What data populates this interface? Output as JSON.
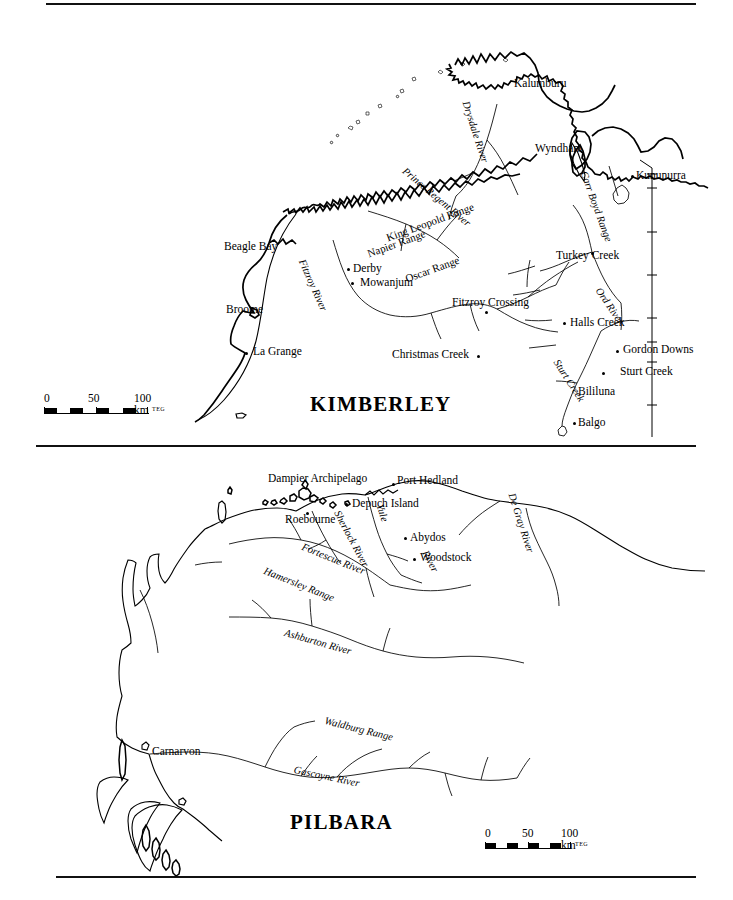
{
  "document": {
    "kind": "two-panel reference map figure",
    "top_rule": true,
    "middle_rule": true,
    "bottom_rule": true
  },
  "maps": [
    {
      "id": "kimberley",
      "title": "KIMBERLEY",
      "settlements": [
        {
          "name": "Kalumburu",
          "x": 514,
          "y": 84,
          "anchor": "left",
          "dot": false
        },
        {
          "name": "Wyndham",
          "x": 535,
          "y": 149,
          "anchor": "left",
          "dot": false
        },
        {
          "name": "Kununurra",
          "x": 636,
          "y": 176,
          "anchor": "left",
          "dot": true,
          "dot_x": 631,
          "dot_y": 174
        },
        {
          "name": "Beagle Bay",
          "x": 224,
          "y": 247,
          "anchor": "left",
          "dot": false
        },
        {
          "name": "Derby",
          "x": 353,
          "y": 269,
          "anchor": "left",
          "dot": true,
          "dot_x": 347,
          "dot_y": 268
        },
        {
          "name": "Mowanjum",
          "x": 360,
          "y": 283,
          "anchor": "left",
          "dot": true,
          "dot_x": 351,
          "dot_y": 281
        },
        {
          "name": "Broome",
          "x": 226,
          "y": 310,
          "anchor": "left",
          "dot": false
        },
        {
          "name": "Turkey Creek",
          "x": 556,
          "y": 256,
          "anchor": "left",
          "dot": true,
          "dot_x": 591,
          "dot_y": 252
        },
        {
          "name": "Fitzroy Crossing",
          "x": 452,
          "y": 303,
          "anchor": "left",
          "dot": true,
          "dot_x": 485,
          "dot_y": 311
        },
        {
          "name": "Halls Creek",
          "x": 570,
          "y": 323,
          "anchor": "left",
          "dot": true,
          "dot_x": 564,
          "dot_y": 322
        },
        {
          "name": "La Grange",
          "x": 253,
          "y": 352,
          "anchor": "left",
          "dot": true,
          "dot_x": 245,
          "dot_y": 353
        },
        {
          "name": "Christmas Creek",
          "x": 392,
          "y": 355,
          "anchor": "left",
          "dot": true,
          "dot_x": 477,
          "dot_y": 355
        },
        {
          "name": "Gordon Downs",
          "x": 623,
          "y": 350,
          "anchor": "left",
          "dot": true,
          "dot_x": 616,
          "dot_y": 350
        },
        {
          "name": "Sturt Creek",
          "x": 620,
          "y": 372,
          "anchor": "left",
          "dot": true,
          "dot_x": 602,
          "dot_y": 372
        },
        {
          "name": "Bililuna",
          "x": 578,
          "y": 392,
          "anchor": "left",
          "dot": false
        },
        {
          "name": "Balgo",
          "x": 578,
          "y": 423,
          "anchor": "left",
          "dot": true,
          "dot_x": 573,
          "dot_y": 422
        }
      ],
      "physical_labels": [
        {
          "name": "Drysdale River",
          "x": 470,
          "y": 100,
          "rotate": 72,
          "style": "italic"
        },
        {
          "name": "Prince Regent River",
          "x": 407,
          "y": 166,
          "rotate": 40,
          "style": "italic"
        },
        {
          "name": "Carr Boyd Range",
          "x": 588,
          "y": 170,
          "rotate": 70,
          "style": "italic"
        },
        {
          "name": "Fitzroy River",
          "x": 306,
          "y": 258,
          "rotate": 66,
          "style": "italic"
        },
        {
          "name": "King Leopold Range",
          "x": 385,
          "y": 233,
          "rotate": 20,
          "style": "italic-upright"
        },
        {
          "name": "Napier Range",
          "x": 366,
          "y": 247,
          "rotate": 20,
          "style": "italic-upright"
        },
        {
          "name": "Oscar Range",
          "x": 404,
          "y": 272,
          "rotate": 20,
          "style": "italic-upright"
        },
        {
          "name": "Ord River",
          "x": 604,
          "y": 289,
          "rotate": 56,
          "style": "italic"
        },
        {
          "name": "Sturt Creek",
          "x": 562,
          "y": 360,
          "rotate": 57,
          "style": "italic"
        }
      ],
      "scale": {
        "zero": "0",
        "mid": "50",
        "max": "100 km",
        "credit": "TEG",
        "x": 44,
        "y": 396
      },
      "title_pos": {
        "x": 310,
        "y": 396
      }
    },
    {
      "id": "pilbara",
      "title": "PILBARA",
      "settlements": [
        {
          "name": "Dampier Archipelago",
          "x": 268,
          "y": 479,
          "anchor": "left",
          "dot": false
        },
        {
          "name": "Port Hedland",
          "x": 397,
          "y": 481,
          "anchor": "left",
          "dot": true,
          "dot_x": 392,
          "dot_y": 484
        },
        {
          "name": "Depuch Island",
          "x": 352,
          "y": 504,
          "anchor": "left",
          "dot": true,
          "dot_x": 345,
          "dot_y": 503
        },
        {
          "name": "Roebourne",
          "x": 285,
          "y": 520,
          "anchor": "left",
          "dot": true,
          "dot_x": 306,
          "dot_y": 512
        },
        {
          "name": "Abydos",
          "x": 410,
          "y": 538,
          "anchor": "left",
          "dot": true,
          "dot_x": 404,
          "dot_y": 537
        },
        {
          "name": "Woodstock",
          "x": 420,
          "y": 558,
          "anchor": "left",
          "dot": true,
          "dot_x": 414,
          "dot_y": 558
        },
        {
          "name": "Carnarvon",
          "x": 152,
          "y": 752,
          "anchor": "left",
          "dot": false
        }
      ],
      "physical_labels": [
        {
          "name": "De Gray River",
          "x": 517,
          "y": 494,
          "rotate": 72,
          "style": "italic"
        },
        {
          "name": "Sherlock River",
          "x": 343,
          "y": 511,
          "rotate": 62,
          "style": "italic"
        },
        {
          "name": "Yule",
          "x": 385,
          "y": 505,
          "rotate": 72,
          "style": "italic"
        },
        {
          "name": "River",
          "x": 430,
          "y": 551,
          "rotate": 62,
          "style": "italic"
        },
        {
          "name": "Fortescue River",
          "x": 305,
          "y": 544,
          "rotate": 22,
          "style": "italic"
        },
        {
          "name": "Hamersley Range",
          "x": 268,
          "y": 568,
          "rotate": 22,
          "style": "italic"
        },
        {
          "name": "Ashburton River",
          "x": 287,
          "y": 629,
          "rotate": 16,
          "style": "italic"
        },
        {
          "name": "Waldburg Range",
          "x": 327,
          "y": 717,
          "rotate": 14,
          "style": "italic"
        },
        {
          "name": "Gascoyne River",
          "x": 296,
          "y": 766,
          "rotate": 12,
          "style": "italic"
        }
      ],
      "scale": {
        "zero": "0",
        "mid": "50",
        "max": "100 km",
        "credit": "TEG",
        "x": 485,
        "y": 831
      },
      "title_pos": {
        "x": 290,
        "y": 813
      }
    }
  ],
  "colors": {
    "ink": "#000000",
    "paper": "#ffffff"
  },
  "icons": {
    "state_border": "border-cross-tick"
  }
}
